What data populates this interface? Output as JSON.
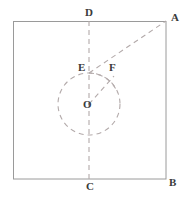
{
  "figure": {
    "kind": "geometry-diagram",
    "canvas": {
      "width": 188,
      "height": 202
    },
    "colors": {
      "background": "#ffffff",
      "solid_stroke": "#9a9a9a",
      "dashed_stroke": "#b0a8a8",
      "label_text": "#3a3a3a"
    },
    "square": {
      "name": "square-ABCD",
      "left": 13,
      "top": 21,
      "right": 166,
      "bottom": 179,
      "stroke_width": 1
    },
    "circle": {
      "name": "circle-O",
      "cx": 89,
      "cy": 104,
      "r": 31,
      "style": "dashed"
    },
    "arc": {
      "name": "arc-E-through-F",
      "cx": 89,
      "cy": 104,
      "r": 31,
      "style": "dashed"
    },
    "segments": [
      {
        "name": "vertical-axis-DC",
        "x1": 89,
        "y1": 21,
        "x2": 89,
        "y2": 179,
        "style": "dashed"
      },
      {
        "name": "diagonal-EA",
        "x1": 89,
        "y1": 73,
        "x2": 166,
        "y2": 21,
        "style": "dashed"
      },
      {
        "name": "radius-OF",
        "x1": 89,
        "y1": 104,
        "x2": 113,
        "y2": 77,
        "style": "dashed"
      }
    ],
    "points": [
      {
        "id": "A",
        "label": "A",
        "x": 166,
        "y": 21
      },
      {
        "id": "B",
        "label": "B",
        "x": 166,
        "y": 179
      },
      {
        "id": "C",
        "label": "C",
        "x": 89,
        "y": 179
      },
      {
        "id": "D",
        "label": "D",
        "x": 89,
        "y": 21
      },
      {
        "id": "E",
        "label": "E",
        "x": 89,
        "y": 73
      },
      {
        "id": "F",
        "label": "F",
        "x": 113,
        "y": 77
      },
      {
        "id": "O",
        "label": "O",
        "x": 89,
        "y": 104
      }
    ]
  }
}
